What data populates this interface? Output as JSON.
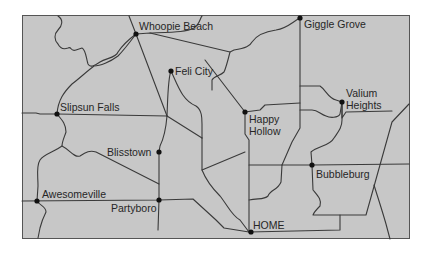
{
  "map": {
    "background_color": "#c7c7c7",
    "border_color": "#555555",
    "road_color": "#3a3a3a",
    "cities": [
      {
        "name": "Whoopie Beach",
        "x": 136,
        "y": 34,
        "label_x": 139,
        "label_y": 30,
        "lines": [
          "Whoopie Beach"
        ]
      },
      {
        "name": "Giggle Grove",
        "x": 300,
        "y": 18,
        "label_x": 304,
        "label_y": 28,
        "lines": [
          "Giggle Grove"
        ]
      },
      {
        "name": "Feli City",
        "x": 171,
        "y": 71,
        "label_x": 175,
        "label_y": 75,
        "lines": [
          "Feli City"
        ]
      },
      {
        "name": "Valium Heights",
        "x": 342,
        "y": 102,
        "label_x": 346,
        "label_y": 97,
        "lines": [
          "Valium",
          "Heights"
        ]
      },
      {
        "name": "Slipsun Falls",
        "x": 57,
        "y": 114,
        "label_x": 60,
        "label_y": 111,
        "lines": [
          "Slipsun Falls"
        ]
      },
      {
        "name": "Happy Hollow",
        "x": 245,
        "y": 112,
        "label_x": 249,
        "label_y": 123,
        "lines": [
          "Happy",
          "Hollow"
        ]
      },
      {
        "name": "Blisstown",
        "x": 159,
        "y": 152,
        "label_x": 107,
        "label_y": 156,
        "lines": [
          "Blisstown"
        ]
      },
      {
        "name": "Bubbleburg",
        "x": 312,
        "y": 165,
        "label_x": 316,
        "label_y": 178,
        "lines": [
          "Bubbleburg"
        ]
      },
      {
        "name": "Awesomeville",
        "x": 37,
        "y": 201,
        "label_x": 42,
        "label_y": 198,
        "lines": [
          "Awesomeville"
        ]
      },
      {
        "name": "Partyboro",
        "x": 159,
        "y": 200,
        "label_x": 111,
        "label_y": 212,
        "lines": [
          "Partyboro"
        ]
      },
      {
        "name": "HOME",
        "x": 251,
        "y": 232,
        "label_x": 253,
        "label_y": 229,
        "lines": [
          "HOME"
        ]
      }
    ]
  }
}
